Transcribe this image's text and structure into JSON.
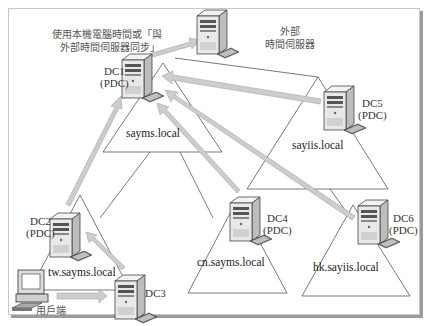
{
  "diagram": {
    "type": "network-time-sync",
    "sync_note": {
      "line1": "使用本機電腦時間或「與",
      "line2": "外部時間伺服器同步」"
    },
    "external_server": {
      "line1": "外部",
      "line2": "時間伺服器"
    },
    "domains": [
      {
        "name": "sayms.local"
      },
      {
        "name": "sayiis.local"
      },
      {
        "name": "tw.sayms.local"
      },
      {
        "name": "cn.sayms.local"
      },
      {
        "name": "hk.sayiis.local"
      }
    ],
    "servers": [
      {
        "id": "DC1",
        "role": "(PDC)"
      },
      {
        "id": "DC2",
        "role": "(PDC)"
      },
      {
        "id": "DC3",
        "role": ""
      },
      {
        "id": "DC4",
        "role": "(PDC)"
      },
      {
        "id": "DC5",
        "role": "(PDC)"
      },
      {
        "id": "DC6",
        "role": "(PDC)"
      }
    ],
    "client": {
      "label": "用戶端"
    },
    "arrows": [
      {
        "from": "DC1",
        "to": "external_server"
      },
      {
        "from": "DC2",
        "to": "DC1"
      },
      {
        "from": "DC3",
        "to": "DC2"
      },
      {
        "from": "client",
        "to": "DC3"
      },
      {
        "from": "DC4",
        "to": "DC1"
      },
      {
        "from": "DC5",
        "to": "DC1"
      },
      {
        "from": "DC6",
        "to": "DC1"
      }
    ],
    "colors": {
      "arrow": "#c8c8c8",
      "arrow_stroke": "#a0a0a0",
      "line": "#555555"
    }
  }
}
